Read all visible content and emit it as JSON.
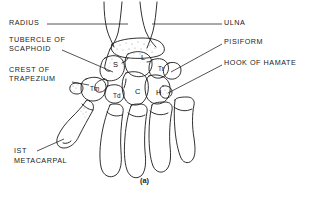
{
  "figure": {
    "caption": "(a)",
    "view": "palmar view of right wrist skeleton",
    "background_color": "#ffffff",
    "line_color": "#1a1a1a",
    "stipple_color": "#8a8a8a"
  },
  "callout_labels": [
    {
      "id": "radius",
      "text": "RADIUS",
      "side": "left",
      "text_x": 9,
      "text_y": 21,
      "leader": "M 47 24 L 128 24"
    },
    {
      "id": "tubercle-of-scaphoid",
      "text_line1": "TUBERCLE OF",
      "text_line2": "SCAPHOID",
      "side": "left",
      "text_x": 9,
      "text_y": 38,
      "leader": "M 62 50 L 113 72"
    },
    {
      "id": "crest-of-trapezium",
      "text_line1": "CREST OF",
      "text_line2": "TRAPEZIUM",
      "side": "left",
      "text_x": 9,
      "text_y": 68,
      "leader": "M 72 82 L 90 84"
    },
    {
      "id": "1st-metacarpal",
      "text_line1": "IST",
      "text_line2": "METACARPAL",
      "side": "left",
      "text_x": 14,
      "text_y": 150,
      "leader": "M 37 151 L 62 138"
    },
    {
      "id": "ulna",
      "text": "ULNA",
      "side": "right",
      "text_x": 224,
      "text_y": 21,
      "leader": "M 222 24 L 155 24"
    },
    {
      "id": "pisiform",
      "text": "PISIFORM",
      "side": "right",
      "text_x": 224,
      "text_y": 40,
      "leader": "M 222 44 L 168 70"
    },
    {
      "id": "hook-of-hamate",
      "text": "HOOK OF HAMATE",
      "side": "right",
      "text_x": 224,
      "text_y": 61,
      "leader": "M 222 65 L 167 92"
    }
  ],
  "bone_letters": [
    {
      "id": "scaphoid",
      "label": "S",
      "x": 113,
      "y": 64,
      "size": "normal"
    },
    {
      "id": "lunate",
      "label": "L",
      "x": 141,
      "y": 57,
      "size": "normal"
    },
    {
      "id": "triquetral",
      "label": "Tr",
      "x": 159,
      "y": 69,
      "size": "small"
    },
    {
      "id": "capitate",
      "label": "C",
      "x": 136,
      "y": 91,
      "size": "normal"
    },
    {
      "id": "hamate",
      "label": "H",
      "x": 157,
      "y": 92,
      "size": "normal"
    },
    {
      "id": "trapezoid",
      "label": "Td",
      "x": 115,
      "y": 95,
      "size": "small"
    },
    {
      "id": "trapezium",
      "label": "Tm",
      "x": 93,
      "y": 88,
      "size": "small"
    }
  ]
}
